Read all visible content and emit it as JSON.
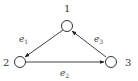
{
  "diagram": {
    "type": "directed-graph",
    "nodes": [
      {
        "id": "1",
        "label": "1"
      },
      {
        "id": "2",
        "label": "2"
      },
      {
        "id": "3",
        "label": "3"
      }
    ],
    "edges": [
      {
        "from": "1",
        "to": "2",
        "label": "e",
        "sub": "1"
      },
      {
        "from": "2",
        "to": "3",
        "label": "e",
        "sub": "2"
      },
      {
        "from": "3",
        "to": "1",
        "label": "e",
        "sub": "3"
      }
    ],
    "colors": {
      "stroke": "#333333",
      "background": "#ffffff"
    }
  }
}
